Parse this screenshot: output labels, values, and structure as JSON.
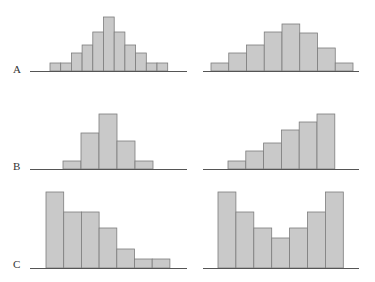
{
  "chart_data": [
    {
      "type": "bar",
      "row_label": "A",
      "panel": "left",
      "description": "Symmetric, bell-shaped, narrow bins",
      "values": [
        8,
        8,
        18,
        26,
        39,
        54,
        39,
        26,
        18,
        8,
        8
      ],
      "geom": {
        "x0": 50,
        "bin_w": 10.7,
        "baseline": 71,
        "axis": [
          30,
          187
        ]
      }
    },
    {
      "type": "bar",
      "row_label": "A",
      "panel": "right",
      "description": "Roughly symmetric, bell-shaped, wider bins",
      "values": [
        8,
        18,
        26,
        39,
        47,
        38,
        23,
        8
      ],
      "geom": {
        "x0": 211,
        "bin_w": 17.75,
        "baseline": 71,
        "axis": [
          203,
          359
        ]
      }
    },
    {
      "type": "bar",
      "row_label": "B",
      "panel": "left",
      "description": "Unimodal, slightly right-skewed, few bins",
      "values": [
        8,
        36,
        55,
        28,
        8
      ],
      "geom": {
        "x0": 63,
        "bin_w": 18,
        "baseline": 169,
        "axis": [
          30,
          187
        ]
      }
    },
    {
      "type": "bar",
      "row_label": "B",
      "panel": "right",
      "description": "Increasing (left-skewed)",
      "values": [
        8,
        18,
        26,
        39,
        47,
        55
      ],
      "geom": {
        "x0": 228,
        "bin_w": 17.8,
        "baseline": 169,
        "axis": [
          203,
          359
        ]
      }
    },
    {
      "type": "bar",
      "row_label": "C",
      "panel": "left",
      "description": "Decreasing (right-skewed)",
      "values": [
        76,
        56,
        56,
        40,
        19,
        9,
        9
      ],
      "geom": {
        "x0": 46,
        "bin_w": 17.7,
        "baseline": 268,
        "axis": [
          30,
          187
        ]
      }
    },
    {
      "type": "bar",
      "row_label": "C",
      "panel": "right",
      "description": "U-shaped (bimodal at extremes)",
      "values": [
        76,
        56,
        40,
        30,
        40,
        56,
        76
      ],
      "geom": {
        "x0": 218,
        "bin_w": 17.9,
        "baseline": 268,
        "axis": [
          203,
          359
        ]
      }
    }
  ],
  "labels": {
    "A": "A",
    "B": "B",
    "C": "C"
  },
  "colors": {
    "bar_fill": "#c9c9c9",
    "bar_stroke": "#7d7d7d",
    "axis": "#555555",
    "label": "#333333"
  }
}
